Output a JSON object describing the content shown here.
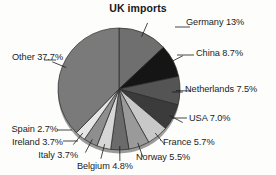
{
  "chart_data": {
    "type": "pie",
    "title": "UK imports",
    "xlabel": "",
    "ylabel": "",
    "legend_position": "none",
    "grid": false,
    "units": "percent",
    "categories": [
      "Germany",
      "China",
      "Netherlands",
      "USA",
      "France",
      "Norway",
      "Belgium",
      "Italy",
      "Ireland",
      "Spain",
      "Other"
    ],
    "values": [
      13.0,
      8.7,
      7.5,
      7.0,
      5.7,
      5.5,
      4.8,
      3.7,
      3.7,
      2.7,
      37.7
    ],
    "start_angle_deg": 0,
    "direction": "clockwise",
    "slices": [
      {
        "name": "Germany",
        "value": 13.0,
        "label": "Germany 13%",
        "color": "#6f6f6f",
        "side": "right"
      },
      {
        "name": "China",
        "value": 8.7,
        "label": "China 8.7%",
        "color": "#151515",
        "side": "right"
      },
      {
        "name": "Netherlands",
        "value": 7.5,
        "label": "Netherlands 7.5%",
        "color": "#545454",
        "side": "right"
      },
      {
        "name": "USA",
        "value": 7.0,
        "label": "USA 7.0%",
        "color": "#3b3b3b",
        "side": "right"
      },
      {
        "name": "France",
        "value": 5.7,
        "label": "France 5.7%",
        "color": "#c8c8c8",
        "side": "right"
      },
      {
        "name": "Norway",
        "value": 5.5,
        "label": "Norway 5.5%",
        "color": "#9a9a9a",
        "side": "right"
      },
      {
        "name": "Belgium",
        "value": 4.8,
        "label": "Belgium 4.8%",
        "color": "#6b6b6b",
        "side": "left"
      },
      {
        "name": "Italy",
        "value": 3.7,
        "label": "Italy 3.7%",
        "color": "#d6d6d6",
        "side": "left"
      },
      {
        "name": "Ireland",
        "value": 3.7,
        "label": "Ireland 3.7%",
        "color": "#8e8e8e",
        "side": "left"
      },
      {
        "name": "Spain",
        "value": 2.7,
        "label": "Spain 2.7%",
        "color": "#e6e6e6",
        "side": "left"
      },
      {
        "name": "Other",
        "value": 37.7,
        "label": "Other 37.7%",
        "color": "#7a7a7a",
        "side": "left"
      }
    ]
  },
  "labels": {
    "germany": "Germany 13%",
    "china": "China 8.7%",
    "netherlands": "Netherlands 7.5%",
    "usa": "USA 7.0%",
    "france": "France 5.7%",
    "norway": "Norway 5.5%",
    "belgium": "Belgium 4.8%",
    "italy": "Italy 3.7%",
    "ireland": "Ireland 3.7%",
    "spain": "Spain 2.7%",
    "other": "Other 37.7%"
  }
}
